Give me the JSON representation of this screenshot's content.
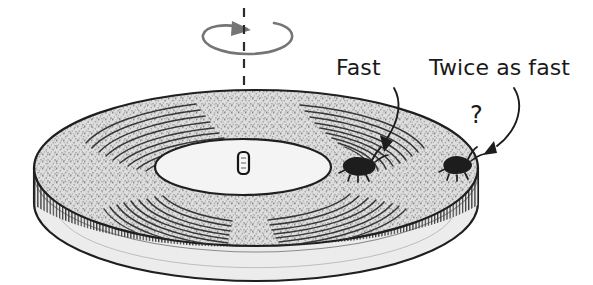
{
  "figure": {
    "background_color": "#ffffff",
    "ink_color": "#1a1a1a",
    "disk_fill_color": "#d8d8d8",
    "hub_fill_color": "#f2f2f2",
    "rim_fill_color": "#e6e6e6",
    "rotation_arrow_color": "#6e6e6e",
    "labels": {
      "fast": "Fast",
      "twice_as_fast": "Twice as fast",
      "question_mark": "?"
    },
    "icons": {
      "rotation_arrow": "rotation-arrow-icon",
      "axis_line": "dashed-axis-icon",
      "spindle": "spindle-icon",
      "bug_inner": "bug-icon",
      "bug_outer": "bug-icon",
      "pointer_fast": "curved-arrow-icon",
      "pointer_twice": "curved-arrow-icon"
    }
  }
}
